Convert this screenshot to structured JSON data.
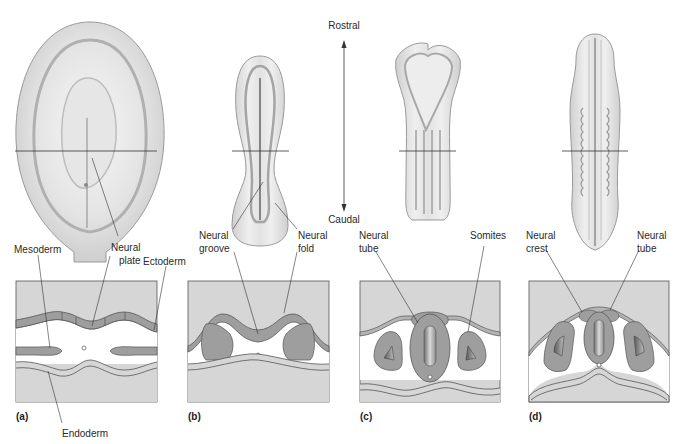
{
  "figure": {
    "axis": {
      "top_label": "Rostral",
      "bottom_label": "Caudal"
    },
    "panels": [
      {
        "letter": "(a)",
        "labels": {
          "mesoderm": "Mesoderm",
          "neural_plate_1": "Neural",
          "neural_plate_2": "plate",
          "ectoderm": "Ectoderm",
          "endoderm": "Endoderm"
        }
      },
      {
        "letter": "(b)",
        "labels": {
          "groove_1": "Neural",
          "groove_2": "groove",
          "fold_1": "Neural",
          "fold_2": "fold"
        }
      },
      {
        "letter": "(c)",
        "labels": {
          "tube_1": "Neural",
          "tube_2": "tube",
          "somites": "Somites"
        }
      },
      {
        "letter": "(d)",
        "labels": {
          "crest_1": "Neural",
          "crest_2": "crest",
          "tube_1": "Neural",
          "tube_2": "tube"
        }
      }
    ]
  },
  "colors": {
    "panel_bg": "#d6d6d6",
    "tissue": "#9e9e9e",
    "tissue_light": "#b4b4b4",
    "cavity": "#ffffff",
    "outline": "#555555",
    "lumen_dark": "#6a6a6a"
  }
}
